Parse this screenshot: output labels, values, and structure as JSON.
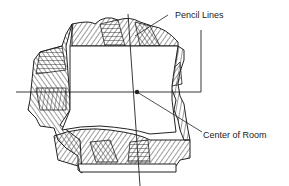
{
  "diagram": {
    "labels": {
      "pencil_lines": "Pencil Lines",
      "center_of_room": "Center of Room"
    },
    "colors": {
      "line": "#222222",
      "background": "#ffffff"
    }
  }
}
